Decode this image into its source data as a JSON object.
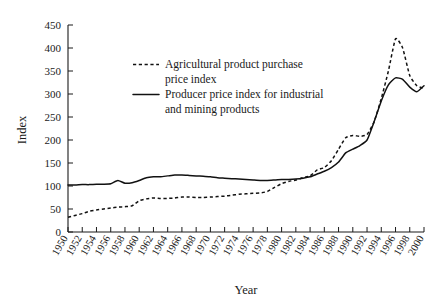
{
  "chart_data": {
    "type": "line",
    "title": "",
    "xlabel": "Year",
    "ylabel": "Index",
    "xlim": [
      1950,
      2000
    ],
    "ylim": [
      0,
      450
    ],
    "ytick_step": 50,
    "xtick_step": 2,
    "grid": false,
    "legend_position": "upper-left-inside",
    "yticks": [
      0,
      50,
      100,
      150,
      200,
      250,
      300,
      350,
      400,
      450
    ],
    "xticks": [
      "1950",
      "1952",
      "1954",
      "1956",
      "1958",
      "1960",
      "1962",
      "1964",
      "1966",
      "1968",
      "1970",
      "1972",
      "1974",
      "1976",
      "1978",
      "1980",
      "1982",
      "1984",
      "1986",
      "1988",
      "1990",
      "1992",
      "1994",
      "1996",
      "1998",
      "2000"
    ],
    "x": [
      1950,
      1951,
      1952,
      1953,
      1954,
      1955,
      1956,
      1957,
      1958,
      1959,
      1960,
      1961,
      1962,
      1963,
      1964,
      1965,
      1966,
      1967,
      1968,
      1969,
      1970,
      1971,
      1972,
      1973,
      1974,
      1975,
      1976,
      1977,
      1978,
      1979,
      1980,
      1981,
      1982,
      1983,
      1984,
      1985,
      1986,
      1987,
      1988,
      1989,
      1990,
      1991,
      1992,
      1993,
      1994,
      1995,
      1996,
      1997,
      1998,
      1999,
      2000
    ],
    "series": [
      {
        "name": "Agricultural product purchase price index",
        "style": "dashed",
        "values": [
          32,
          36,
          40,
          45,
          48,
          50,
          52,
          54,
          55,
          57,
          68,
          72,
          74,
          73,
          73,
          74,
          76,
          76,
          75,
          75,
          76,
          77,
          78,
          80,
          82,
          83,
          84,
          85,
          88,
          97,
          105,
          110,
          113,
          118,
          122,
          135,
          140,
          155,
          180,
          205,
          210,
          208,
          212,
          240,
          290,
          350,
          420,
          400,
          340,
          318,
          312
        ]
      },
      {
        "name": "Producer price index for industrial and mining products",
        "style": "solid",
        "values": [
          102,
          102,
          103,
          103,
          104,
          104,
          105,
          112,
          106,
          107,
          112,
          118,
          120,
          120,
          122,
          124,
          124,
          123,
          122,
          121,
          120,
          118,
          117,
          116,
          115,
          114,
          113,
          112,
          112,
          113,
          114,
          114,
          115,
          117,
          120,
          126,
          132,
          140,
          152,
          172,
          180,
          188,
          200,
          240,
          285,
          320,
          335,
          332,
          315,
          305,
          318
        ]
      }
    ]
  },
  "legend": {
    "entries": [
      {
        "line1": "Agricultural product purchase",
        "line2": "price index",
        "style": "dashed"
      },
      {
        "line1": "Producer price index for industrial",
        "line2": "and mining products",
        "style": "solid"
      }
    ]
  },
  "axes": {
    "y_title": "Index",
    "x_title": "Year"
  }
}
